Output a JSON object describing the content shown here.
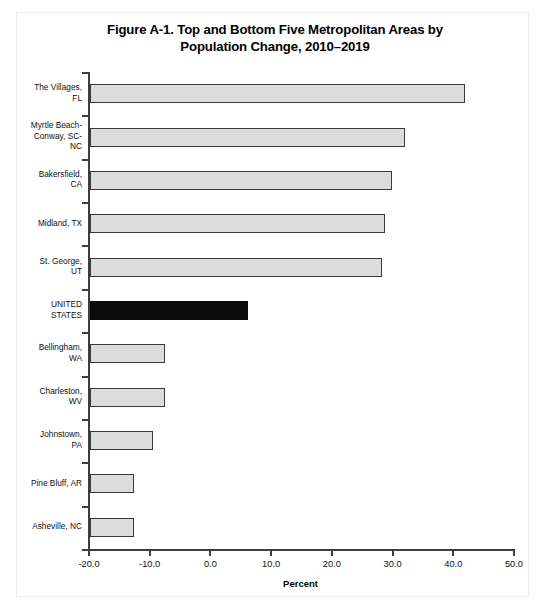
{
  "figure": {
    "title_line1": "Figure A-1. Top and Bottom Five Metropolitan Areas by",
    "title_line2": "Population Change, 2010–2019"
  },
  "chart_data": {
    "type": "bar",
    "orientation": "horizontal",
    "title": "Figure A-1. Top and Bottom Five Metropolitan Areas by Population Change, 2010–2019",
    "xlabel": "Percent",
    "ylabel": "",
    "xlim": [
      -20.0,
      50.0
    ],
    "xticks": [
      -20.0,
      -10.0,
      0.0,
      10.0,
      20.0,
      30.0,
      40.0,
      50.0
    ],
    "xticklabels": [
      "-20.0",
      "-10.0",
      "0.0",
      "10.0",
      "20.0",
      "30.0",
      "40.0",
      "50.0"
    ],
    "grid": false,
    "legend": "none",
    "bar_baseline": -20.0,
    "categories": [
      "The Villages, FL",
      "Myrtle Beach-Conway, SC-NC",
      "Bakersfield, CA",
      "Midland, TX",
      "St. George, UT",
      "UNITED STATES",
      "Bellingham, WA",
      "Charleston, WV",
      "Johnstown, PA",
      "Pine Bluff, AR",
      "Asheville, NC"
    ],
    "category_label_lines": [
      [
        "The Villages,",
        "FL"
      ],
      [
        "Myrtle Beach-",
        "Conway, SC-",
        "NC"
      ],
      [
        "Bakersfield,",
        "CA"
      ],
      [
        "Midland, TX"
      ],
      [
        "St. George,",
        "UT"
      ],
      [
        "UNITED",
        "STATES"
      ],
      [
        "Bellingham,",
        "WA"
      ],
      [
        "Charleston,",
        "WV"
      ],
      [
        "Johnstown,",
        "PA"
      ],
      [
        "Pine Bluff, AR"
      ],
      [
        "Asheville, NC"
      ]
    ],
    "values": [
      42.1,
      32.2,
      30.1,
      28.9,
      28.5,
      6.3,
      -7.3,
      -7.4,
      -9.3,
      -12.4,
      -12.4
    ],
    "highlight_index": 5,
    "colors": {
      "bar_fill": "#dcdcdc",
      "bar_edge": "#3a3a3a",
      "highlight_fill": "#0b0b0b",
      "axis": "#3d3d3d",
      "text": "#111111"
    }
  }
}
